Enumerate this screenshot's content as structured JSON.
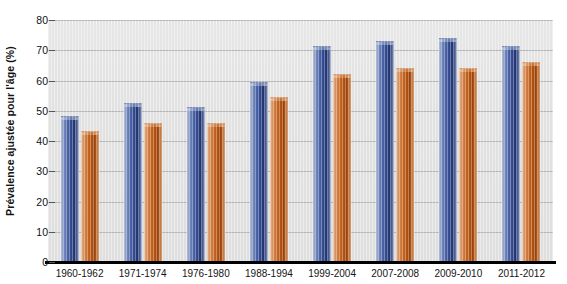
{
  "chart_data": {
    "type": "bar",
    "title": "",
    "xlabel": "",
    "ylabel": "Prévalence ajustée pour l'âge (%)",
    "ylim": [
      0,
      80
    ],
    "ytick_labels": [
      "80",
      "70",
      "60",
      "50",
      "40",
      "30",
      "20",
      "10",
      "0"
    ],
    "ytick_values": [
      80,
      70,
      60,
      50,
      40,
      30,
      20,
      10,
      0
    ],
    "grid": true,
    "legend_position": "none",
    "categories": [
      "1960-1962",
      "1971-1974",
      "1976-1980",
      "1988-1994",
      "1999-2004",
      "2007-2008",
      "2009-2010",
      "2011-2012"
    ],
    "series": [
      {
        "name": "serie-bleue",
        "color": "#31488f",
        "values": [
          48.3,
          52.5,
          51.3,
          59.5,
          71.5,
          73.0,
          74.0,
          71.5
        ]
      },
      {
        "name": "serie-orange",
        "color": "#b75512",
        "values": [
          43.3,
          46.0,
          46.0,
          54.5,
          62.0,
          64.0,
          64.0,
          66.0
        ]
      }
    ]
  },
  "colors": {
    "plot_background": "#e6e6e6",
    "gridline": "#b7b7b7",
    "axis": "#000000",
    "text": "#141414"
  }
}
